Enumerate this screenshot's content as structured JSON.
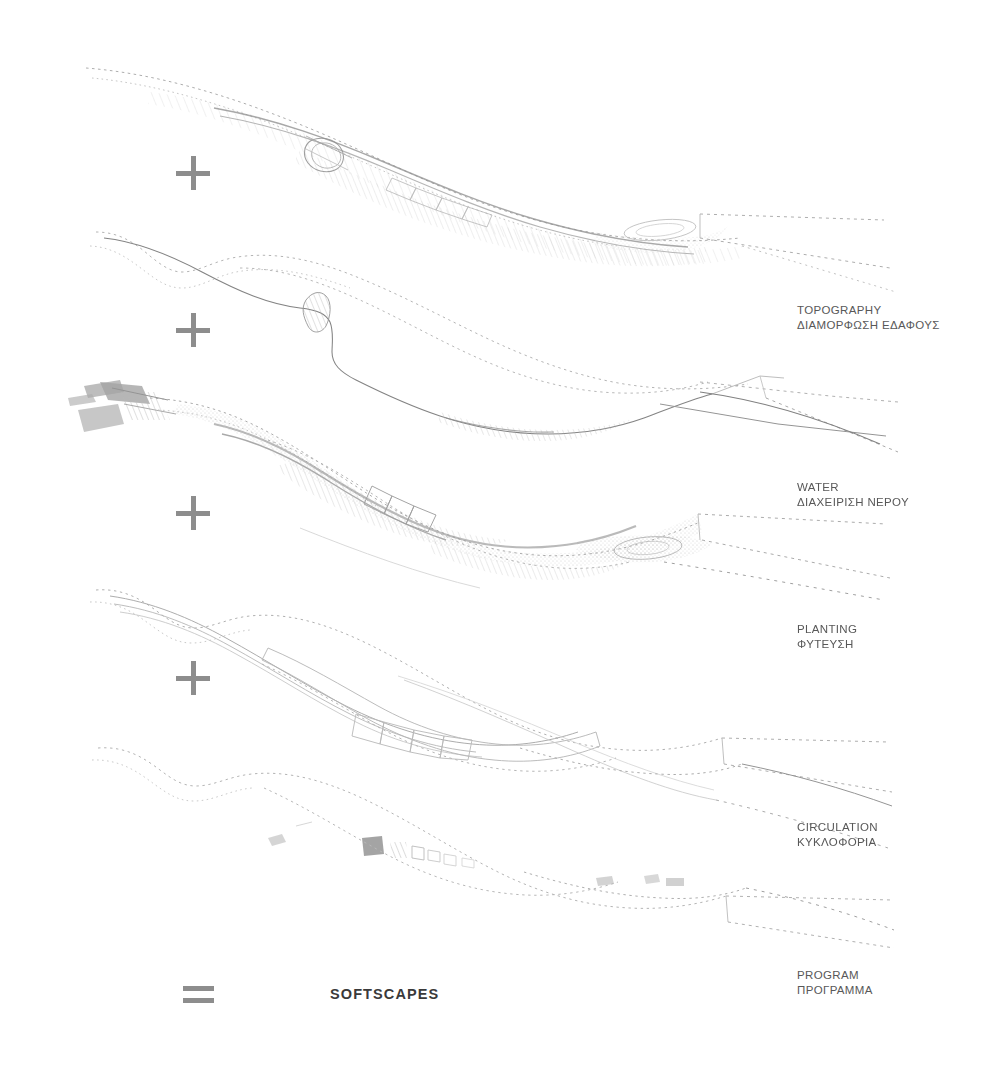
{
  "canvas": {
    "width": 1008,
    "height": 1066,
    "background": "#ffffff",
    "ink_color": "#9a9a9a",
    "label_color": "#585858",
    "operator_color": "#8d8d8d",
    "title_color": "#3a3a3a"
  },
  "operators": [
    {
      "name": "plus-1",
      "symbol": "+",
      "x": 176,
      "y": 156
    },
    {
      "name": "plus-2",
      "symbol": "+",
      "x": 176,
      "y": 313
    },
    {
      "name": "plus-3",
      "symbol": "+",
      "x": 176,
      "y": 496
    },
    {
      "name": "plus-4",
      "symbol": "+",
      "x": 176,
      "y": 661
    },
    {
      "name": "equals",
      "symbol": "=",
      "x": 183,
      "y": 986
    }
  ],
  "layers": [
    {
      "id": "topography",
      "en": "TOPOGRAPHY",
      "el": "ΔΙΑΜΟΡΦΩΣΗ ΕΔΑΦΟΥΣ",
      "label_x": 797,
      "label_y": 303,
      "band_y": 150,
      "density": "high",
      "description": "dense hatched terrain strip with layered contour bands"
    },
    {
      "id": "water",
      "en": "WATER",
      "el": "ΔΙΑΧΕΙΡΙΣΗ ΝΕΡΟΥ",
      "label_x": 797,
      "label_y": 480,
      "band_y": 315,
      "density": "medium",
      "description": "open channel line with small basin shading"
    },
    {
      "id": "planting",
      "en": "PLANTING",
      "el": "ΦΥΤΕΥΣΗ",
      "label_x": 797,
      "label_y": 622,
      "band_y": 482,
      "density": "high",
      "description": "stippled vegetation corridor with rectangular plots"
    },
    {
      "id": "circulation",
      "en": "CIRCULATION",
      "el": "ΚΥΚΛΟΦΟΡΙΑ",
      "label_x": 797,
      "label_y": 820,
      "band_y": 648,
      "density": "low",
      "description": "thin path lines weaving along the corridor"
    },
    {
      "id": "program",
      "en": "PROGRAM",
      "el": "ΠΡΟΓΡΑΜΜΑ",
      "label_x": 797,
      "label_y": 968,
      "band_y": 815,
      "density": "sparse",
      "description": "sparse program blocks scattered along the corridor"
    }
  ],
  "result": {
    "title": "SOFTSCAPES",
    "x": 330,
    "y": 986
  }
}
